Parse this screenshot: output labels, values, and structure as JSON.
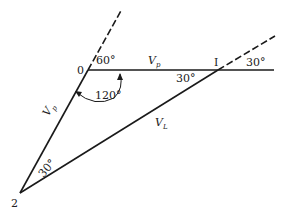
{
  "diagram": {
    "points": {
      "p0": {
        "label": "0",
        "x": 88,
        "y": 70
      },
      "pI": {
        "label": "I",
        "x": 218,
        "y": 70
      },
      "p2": {
        "label": "2",
        "x": 20,
        "y": 193
      }
    },
    "labels": {
      "angle_60": "60°",
      "angle_120": "120°",
      "angle_30_right": "30°",
      "angle_30_at_I": "30°",
      "angle_30_at_2": "30°",
      "vp_top_main": "V",
      "vp_top_sub": "p",
      "vp_left_main": "V",
      "vp_left_sub": "p",
      "vl_main": "V",
      "vl_sub": "L"
    },
    "colors": {
      "stroke": "#1a1a1a",
      "background": "#ffffff"
    }
  }
}
